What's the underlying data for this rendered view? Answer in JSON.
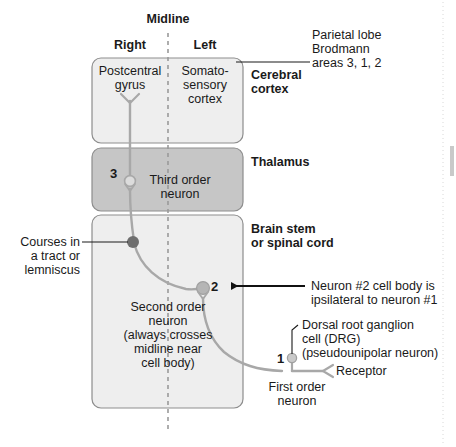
{
  "diagram": {
    "orientation_labels": {
      "midline": "Midline",
      "right": "Right",
      "left": "Left"
    },
    "colors": {
      "box_fill_light": "#eeeeee",
      "box_fill_dark": "#c6c6c6",
      "box_stroke": "#8d8d8d",
      "neuron_stroke": "#a8a8a8",
      "cell_body_dark": "#6e6e6e",
      "cell_body_light": "#b5b5b5",
      "text": "#1a1a1a",
      "arrow": "#111111",
      "midline_dash": "#9a9a9a"
    },
    "regions": [
      {
        "id": "cerebral-cortex",
        "right_label": "Cerebral\ncortex",
        "inner_right_side": "Postcentral\ngyrus",
        "inner_left_side": "Somato-\nsensory\ncortex",
        "callout": "Parietal lobe\nBrodmann\nareas 3, 1, 2"
      },
      {
        "id": "thalamus",
        "right_label": "Thalamus",
        "neuron_number": "3",
        "neuron_label": "Third order\nneuron"
      },
      {
        "id": "brain-stem-spinal-cord",
        "right_label": "Brain stem\nor spinal cord",
        "neuron_number": "2",
        "neuron_label": "Second order\nneuron\n(always crosses\nmidline near\ncell body)"
      }
    ],
    "annotations": {
      "tract": "Courses in\na tract or\nlemniscus",
      "neuron2_note": "Neuron #2 cell body is\nipsilateral to neuron #1",
      "drg": "Dorsal root ganglion\ncell (DRG)\n(pseudounipolar neuron)",
      "receptor": "Receptor",
      "first_order_number": "1",
      "first_order_label": "First order\nneuron"
    }
  }
}
